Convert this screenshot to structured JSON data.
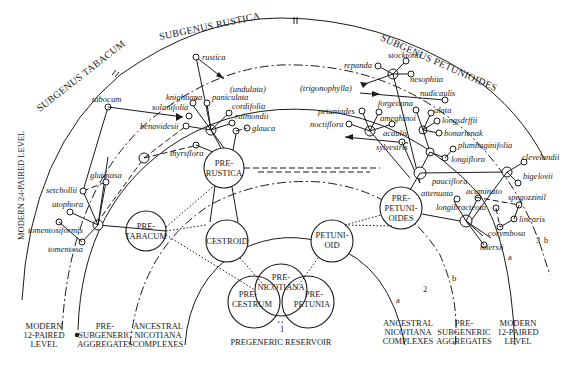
{
  "diagram": {
    "subgenera": {
      "tabacum": "SUBGENUS TABACUM",
      "rustica": "SUBGENUS RUSTICA",
      "petunioides": "SUBGENUS PETUNIOIDES"
    },
    "levels": {
      "modern_24": "MODERN 24-PAIRED LEVEL",
      "left": {
        "modern_12": [
          "MODERN",
          "12-PAIRED",
          "LEVEL"
        ],
        "pre_subgeneric": [
          "PRE-",
          "SUBGENERIC",
          "AGGREGATES"
        ],
        "ancestral": [
          "ANCESTRAL",
          "NICOTIANA",
          "COMPLEXES"
        ]
      },
      "center": "PREGENERIC RESERVOIR",
      "right": {
        "ancestral": [
          "ANCESTRAL",
          "NICOTIANA",
          "COMPLEXES"
        ],
        "pre_subgeneric": [
          "PRE-",
          "SUBGENERIC",
          "AGGREGATES"
        ],
        "modern_12": [
          "MODERN",
          "12-PAIRED",
          "LEVEL"
        ]
      }
    },
    "ancestral_groups": {
      "pre_nicotiana": [
        "PRE-",
        "NICOTIANA"
      ],
      "pre_cestrum": [
        "PRE-",
        "CESTRUM"
      ],
      "pre_petunia": [
        "PRE-",
        "PETUNIA"
      ],
      "cestroid": "CESTROID",
      "petunioid": [
        "PETUNI-",
        "OID"
      ],
      "pre_tabacum": [
        "PRE-",
        "TABACUM"
      ],
      "pre_rustica": [
        "PRE-",
        "RUSTICA"
      ],
      "pre_petunioides": [
        "PRE-",
        "PETUNI-",
        "OIDES"
      ]
    },
    "markers": {
      "one": "1",
      "two": "2",
      "three": "3",
      "a_center": "a",
      "b_center": "b",
      "a_right": "a",
      "b_right": "b"
    },
    "species": {
      "tabacum_group": [
        "tabocum",
        "setchollii",
        "glutinasa",
        "utophora",
        "tomentosiformis",
        "tomentosa"
      ],
      "rustica_group": [
        "rustica",
        "(undulata)",
        "knightiana",
        "paniculata",
        "solanifolia",
        "cordifolia",
        "raimondii",
        "benavidesii",
        "glauca",
        "thyrsflora"
      ],
      "petunioides_group": [
        "stocktonii",
        "repanda",
        "nesophita",
        "(trigonophylla)",
        "nudicaulis",
        "forgetiana",
        "petuniades",
        "alata",
        "ameghinoi",
        "longsdrffii",
        "noctiflora",
        "acaulis",
        "bonarienak",
        "sylvestris",
        "plumbaginifolia",
        "longiflora",
        "clevelandii",
        "bigelovii",
        "pauciflora",
        "attenuata",
        "acuminato",
        "spegozzinil",
        "longibracteota",
        "linearis",
        "corymbosa",
        "miersii"
      ]
    }
  }
}
